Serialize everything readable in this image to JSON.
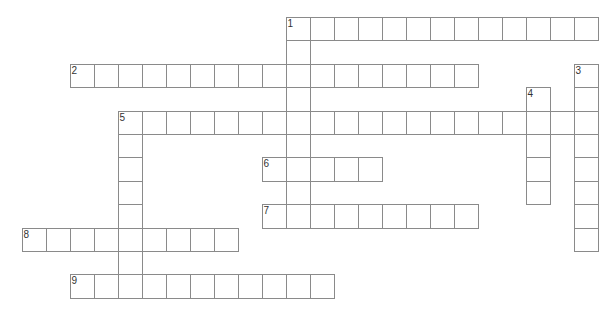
{
  "puzzle": {
    "type": "crossword",
    "grid_origin": {
      "x": 21.5,
      "y": 17
    },
    "cell_size": {
      "w": 24,
      "h": 23.4
    },
    "border_color": "#8a8a8a",
    "number_color": "#333333",
    "entries": [
      {
        "number": "1",
        "direction": "across",
        "row": 0,
        "col": 11,
        "length": 13
      },
      {
        "number": "1",
        "direction": "down",
        "row": 0,
        "col": 11,
        "length": 9
      },
      {
        "number": "2",
        "direction": "across",
        "row": 2,
        "col": 2,
        "length": 17
      },
      {
        "number": "3",
        "direction": "down",
        "row": 2,
        "col": 23,
        "length": 8
      },
      {
        "number": "4",
        "direction": "down",
        "row": 3,
        "col": 21,
        "length": 5
      },
      {
        "number": "5",
        "direction": "across",
        "row": 4,
        "col": 4,
        "length": 20
      },
      {
        "number": "5",
        "direction": "down",
        "row": 4,
        "col": 4,
        "length": 8
      },
      {
        "number": "6",
        "direction": "across",
        "row": 6,
        "col": 10,
        "length": 5
      },
      {
        "number": "7",
        "direction": "across",
        "row": 8,
        "col": 10,
        "length": 9
      },
      {
        "number": "8",
        "direction": "across",
        "row": 9,
        "col": 0,
        "length": 9
      },
      {
        "number": "9",
        "direction": "across",
        "row": 11,
        "col": 2,
        "length": 11
      }
    ]
  }
}
